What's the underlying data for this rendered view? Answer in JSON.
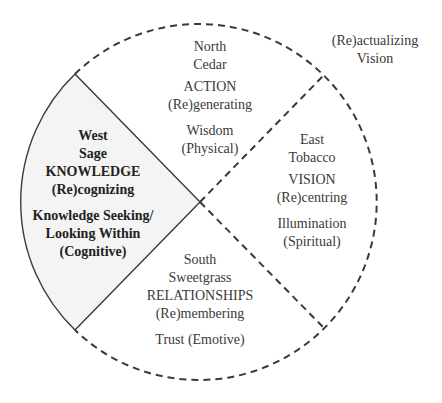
{
  "diagram": {
    "outer_label": {
      "line1": "(Re)actualizing",
      "line2": "Vision"
    },
    "quadrants": {
      "north": {
        "direction": "North",
        "medicine": "Cedar",
        "theme": "ACTION",
        "process": "(Re)generating",
        "quality": "Wisdom",
        "domain": "(Physical)"
      },
      "east": {
        "direction": "East",
        "medicine": "Tobacco",
        "theme": "VISION",
        "process": "(Re)centring",
        "quality": "Illumination",
        "domain": "(Spiritual)"
      },
      "south": {
        "direction": "South",
        "medicine": "Sweetgrass",
        "theme": "RELATIONSHIPS",
        "process": "(Re)membering",
        "quality": "Trust (Emotive)"
      },
      "west": {
        "direction": "West",
        "medicine": "Sage",
        "theme": "KNOWLEDGE",
        "process": "(Re)cognizing",
        "quality_line1": "Knowledge Seeking/",
        "quality_line2": "Looking Within",
        "domain": "(Cognitive)"
      }
    },
    "colors": {
      "stroke": "#3a3a3a",
      "west_fill": "#f4f4f4",
      "background": "#ffffff"
    }
  }
}
